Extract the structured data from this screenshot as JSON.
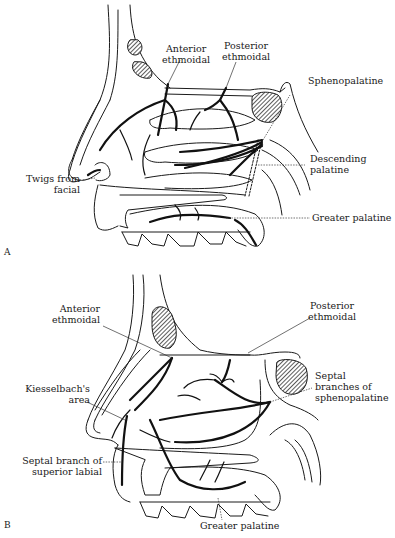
{
  "figure": {
    "panels": [
      {
        "id": "A",
        "view": "Lateral nasal wall",
        "labels": [
          {
            "lines": [
              "Anterior",
              "ethmoidal"
            ]
          },
          {
            "lines": [
              "Posterior",
              "ethmoidal"
            ]
          },
          {
            "lines": [
              "Sphenopalatine"
            ]
          },
          {
            "lines": [
              "Descending",
              "palatine"
            ]
          },
          {
            "lines": [
              "Twigs from",
              "facial"
            ]
          },
          {
            "lines": [
              "Greater palatine"
            ]
          }
        ],
        "panel_letter": "A"
      },
      {
        "id": "B",
        "view": "Nasal septum",
        "labels": [
          {
            "lines": [
              "Anterior",
              "ethmoidal"
            ]
          },
          {
            "lines": [
              "Posterior",
              "ethmoidal"
            ]
          },
          {
            "lines": [
              "Kiesselbach's",
              "area"
            ]
          },
          {
            "lines": [
              "Septal",
              "branches of",
              "sphenopalatine"
            ]
          },
          {
            "lines": [
              "Septal branch of",
              "superior labial"
            ]
          },
          {
            "lines": [
              "Greater palatine"
            ]
          }
        ],
        "panel_letter": "B"
      }
    ]
  },
  "colors": {
    "ink": "#1a1a1a",
    "background": "#ffffff",
    "sinus_fill": "#888888"
  }
}
